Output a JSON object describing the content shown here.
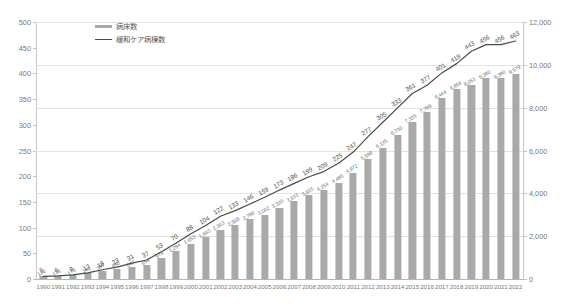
{
  "chart_data": {
    "type": "bar",
    "title": "",
    "xlabel": "",
    "ylabel": "",
    "grid": true,
    "legend_position": "top-left",
    "categories": [
      "1990",
      "1991",
      "1992",
      "1993",
      "1994",
      "1995",
      "1996",
      "1997",
      "1998",
      "1999",
      "2000",
      "2001",
      "2002",
      "2003",
      "2004",
      "2005",
      "2006",
      "2007",
      "2008",
      "2009",
      "2010",
      "2011",
      "2012",
      "2013",
      "2014",
      "2015",
      "2016",
      "2017",
      "2018",
      "2019",
      "2020",
      "2021",
      "2022"
    ],
    "left_axis": {
      "label": "緩和ケア病棟数",
      "ylim": [
        0,
        500
      ],
      "ticks": [
        0,
        50,
        100,
        150,
        200,
        250,
        300,
        350,
        400,
        450,
        500
      ],
      "tick_labels": [
        "0",
        "50",
        "100",
        "150",
        "200",
        "250",
        "300",
        "350",
        "400",
        "450",
        "500"
      ]
    },
    "right_axis": {
      "label": "病床数",
      "ylim": [
        0,
        12000
      ],
      "ticks": [
        0,
        2000,
        4000,
        6000,
        8000,
        10000,
        12000
      ],
      "tick_labels": [
        "0",
        "2,000",
        "4,000",
        "6,000",
        "8,000",
        "10,000",
        "12,000"
      ]
    },
    "series": [
      {
        "name": "病床数",
        "type": "bar",
        "axis": "right",
        "color": "#a9a9a9",
        "values": [
          120,
          133,
          173,
          262,
          397,
          480,
          547,
          654,
          974,
          1294,
          1653,
          1943,
          2303,
          2508,
          2786,
          3002,
          3320,
          3631,
          3915,
          4154,
          4485,
          4972,
          5598,
          6125,
          6730,
          7325,
          7789,
          8444,
          8856,
          9051,
          9380,
          9380,
          9579
        ],
        "value_labels": [
          "120",
          "133",
          "173",
          "262",
          "397",
          "480",
          "547",
          "654",
          "974",
          "1,294",
          "1,653",
          "1,943",
          "2,303",
          "2,508",
          "2,786",
          "3,002",
          "3,320",
          "3,631",
          "3,915",
          "4,154",
          "4,485",
          "4,972",
          "5,598",
          "6,125",
          "6,730",
          "7,325",
          "7,789",
          "8,444",
          "8,856",
          "9,051",
          "9,380",
          "9,380",
          "9,579"
        ]
      },
      {
        "name": "緩和ケア病棟数",
        "type": "line",
        "axis": "left",
        "color": "#4a4a4a",
        "values": [
          5,
          6,
          8,
          12,
          18,
          23,
          31,
          37,
          53,
          70,
          88,
          104,
          122,
          133,
          146,
          159,
          173,
          186,
          199,
          209,
          225,
          247,
          277,
          305,
          333,
          361,
          377,
          401,
          419,
          443,
          456,
          456,
          463
        ],
        "value_labels": [
          "5",
          "6",
          "8",
          "12",
          "18",
          "23",
          "31",
          "37",
          "53",
          "70",
          "88",
          "104",
          "122",
          "133",
          "146",
          "159",
          "173",
          "186",
          "199",
          "209",
          "225",
          "247",
          "277",
          "305",
          "333",
          "361",
          "377",
          "401",
          "419",
          "443",
          "456",
          "456",
          "463"
        ]
      }
    ]
  },
  "legend": {
    "items": [
      {
        "label": "病床数",
        "marker": "bar-swatch"
      },
      {
        "label": "緩和ケア病棟数",
        "marker": "line-swatch"
      }
    ]
  }
}
